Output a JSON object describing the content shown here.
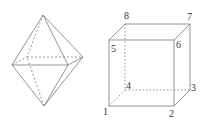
{
  "figure": {
    "stroke_color": "#7a7a7a",
    "octahedron": {
      "vertices": {
        "top": [
          43,
          15
        ],
        "bottom": [
          44,
          106
        ],
        "left": [
          12,
          65
        ],
        "front_right": [
          68,
          65
        ],
        "right": [
          83,
          57
        ],
        "back_left": [
          27,
          57
        ]
      }
    },
    "cube": {
      "labels": {
        "v1": "1",
        "v2": "2",
        "v3": "3",
        "v4": "4",
        "v5": "5",
        "v6": "6",
        "v7": "7",
        "v8": "8"
      }
    }
  }
}
